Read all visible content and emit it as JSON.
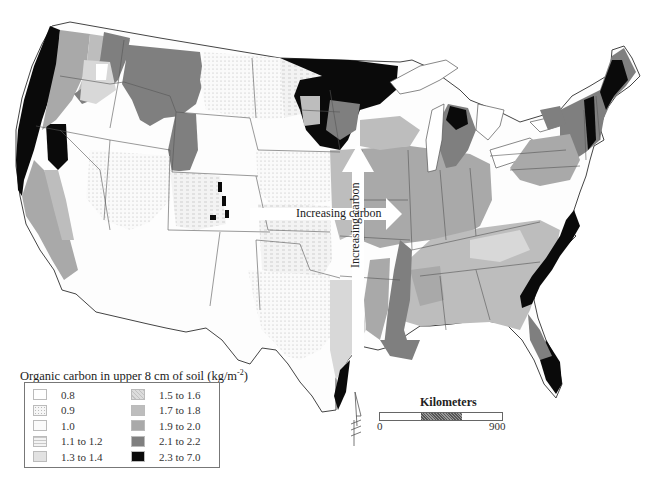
{
  "map": {
    "subject": "Contiguous United States",
    "arrows": [
      {
        "label": "Increasing carbon",
        "direction": "east"
      },
      {
        "label": "Increasing carbon",
        "direction": "north"
      }
    ]
  },
  "legend": {
    "title": "Organic carbon in upper 8 cm of soil (kg/m",
    "title_unit_exponent": "-2",
    "title_close": ")",
    "items": [
      {
        "label": "0.8",
        "color": "#ffffff",
        "pattern": "none"
      },
      {
        "label": "0.9",
        "color": "#f4f4f4",
        "pattern": "dots"
      },
      {
        "label": "1.0",
        "color": "#fbfbfb",
        "pattern": "none"
      },
      {
        "label": "1.1 to 1.2",
        "color": "#efefef",
        "pattern": "dashes"
      },
      {
        "label": "1.3 to 1.4",
        "color": "#e2e2e2",
        "pattern": "none"
      },
      {
        "label": "1.5 to 1.6",
        "color": "#d8d8d8",
        "pattern": "hatch"
      },
      {
        "label": "1.7 to 1.8",
        "color": "#bdbdbd",
        "pattern": "none"
      },
      {
        "label": "1.9 to 2.0",
        "color": "#a9a9a9",
        "pattern": "none"
      },
      {
        "label": "2.1 to 2.2",
        "color": "#7f7f7f",
        "pattern": "none"
      },
      {
        "label": "2.3 to 7.0",
        "color": "#0a0a0a",
        "pattern": "none"
      }
    ]
  },
  "scale": {
    "title": "Kilometers",
    "min": "0",
    "max": "900"
  },
  "north_arrow": {
    "symbol": "N"
  }
}
